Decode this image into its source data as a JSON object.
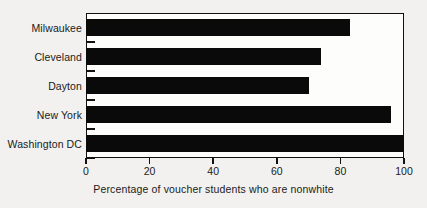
{
  "chart_data": {
    "type": "bar",
    "orientation": "horizontal",
    "title": "",
    "xlabel": "Percentage of voucher students who are nonwhite",
    "ylabel": "",
    "categories": [
      "Milwaukee",
      "Cleveland",
      "Dayton",
      "New York",
      "Washington DC"
    ],
    "values": [
      83,
      74,
      70,
      96,
      100
    ],
    "xlim": [
      0,
      100
    ],
    "xticks": [
      0,
      20,
      40,
      60,
      80,
      100
    ],
    "xtick_labels": [
      "0",
      "20",
      "40",
      "60",
      "80",
      "100"
    ],
    "grid": false,
    "legend": null,
    "bar_color": "#0a0a0a",
    "frame_color": "#111111",
    "background_color": "#f2f1ef",
    "plot_background_color": "#fdfdfc"
  }
}
